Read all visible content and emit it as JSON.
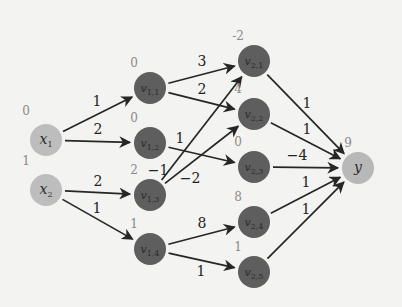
{
  "diagram": {
    "type": "neural-network",
    "colors": {
      "input_node": "#bdbdbd",
      "hidden_node": "#5e5e5e",
      "output_node": "#b8b8b8",
      "edge": "#262626",
      "value_text": "#8a8a8a"
    },
    "nodes": [
      {
        "id": "x1",
        "name": "x",
        "sub": "1",
        "value": "0",
        "kind": "input",
        "cx": 46,
        "cy": 140
      },
      {
        "id": "x2",
        "name": "x",
        "sub": "2",
        "value": "1",
        "kind": "input",
        "cx": 46,
        "cy": 190
      },
      {
        "id": "v11",
        "name": "v",
        "sub": "1,1",
        "value": "0",
        "kind": "hidden",
        "cx": 150,
        "cy": 88
      },
      {
        "id": "v12",
        "name": "v",
        "sub": "1,2",
        "value": "0",
        "kind": "hidden",
        "cx": 150,
        "cy": 143
      },
      {
        "id": "v13",
        "name": "v",
        "sub": "1,3",
        "value": "2",
        "kind": "hidden",
        "cx": 150,
        "cy": 195
      },
      {
        "id": "v14",
        "name": "v",
        "sub": "1,4",
        "value": "1",
        "kind": "hidden",
        "cx": 150,
        "cy": 249
      },
      {
        "id": "v21",
        "name": "v",
        "sub": "2,1",
        "value": "-2",
        "kind": "hidden",
        "cx": 254,
        "cy": 61
      },
      {
        "id": "v22",
        "name": "v",
        "sub": "2,2",
        "value": "4",
        "kind": "hidden",
        "cx": 254,
        "cy": 114
      },
      {
        "id": "v23",
        "name": "v",
        "sub": "2,3",
        "value": "0",
        "kind": "hidden",
        "cx": 254,
        "cy": 167
      },
      {
        "id": "v24",
        "name": "v",
        "sub": "2,4",
        "value": "8",
        "kind": "hidden",
        "cx": 254,
        "cy": 222
      },
      {
        "id": "v25",
        "name": "v",
        "sub": "2,5",
        "value": "1",
        "kind": "hidden",
        "cx": 254,
        "cy": 272
      },
      {
        "id": "y",
        "name": "y",
        "sub": "",
        "value": "9",
        "kind": "output",
        "cx": 358,
        "cy": 168
      }
    ],
    "edges": [
      {
        "from": "x1",
        "to": "v11",
        "weight": "1",
        "lx": 97,
        "ly": 106
      },
      {
        "from": "x1",
        "to": "v12",
        "weight": "2",
        "lx": 98,
        "ly": 134
      },
      {
        "from": "x2",
        "to": "v13",
        "weight": "2",
        "lx": 98,
        "ly": 186
      },
      {
        "from": "x2",
        "to": "v14",
        "weight": "1",
        "lx": 97,
        "ly": 213
      },
      {
        "from": "v11",
        "to": "v21",
        "weight": "3",
        "lx": 202,
        "ly": 66
      },
      {
        "from": "v11",
        "to": "v22",
        "weight": "2",
        "lx": 202,
        "ly": 94
      },
      {
        "from": "v12",
        "to": "v23",
        "weight": "1",
        "lx": 180,
        "ly": 143
      },
      {
        "from": "v13",
        "to": "v21",
        "weight": "−1",
        "lx": 158,
        "ly": 175
      },
      {
        "from": "v13",
        "to": "v22",
        "weight": "−2",
        "lx": 190,
        "ly": 183
      },
      {
        "from": "v14",
        "to": "v24",
        "weight": "8",
        "lx": 202,
        "ly": 228
      },
      {
        "from": "v14",
        "to": "v25",
        "weight": "1",
        "lx": 201,
        "ly": 276
      },
      {
        "from": "v21",
        "to": "y",
        "weight": "1",
        "lx": 307,
        "ly": 108
      },
      {
        "from": "v22",
        "to": "y",
        "weight": "1",
        "lx": 307,
        "ly": 134
      },
      {
        "from": "v23",
        "to": "y",
        "weight": "−4",
        "lx": 297,
        "ly": 160
      },
      {
        "from": "v24",
        "to": "y",
        "weight": "1",
        "lx": 306,
        "ly": 187
      },
      {
        "from": "v25",
        "to": "y",
        "weight": "1",
        "lx": 306,
        "ly": 214
      }
    ]
  }
}
